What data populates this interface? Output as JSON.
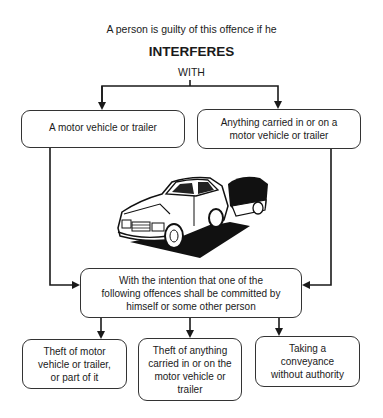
{
  "diagram": {
    "intro": "A person is guilty of this offence if he",
    "title": "INTERFERES",
    "connector": "WITH",
    "targets": [
      {
        "lines": [
          "A motor vehicle or trailer"
        ]
      },
      {
        "lines": [
          "Anything carried in or on a",
          "motor vehicle or trailer"
        ]
      }
    ],
    "image": {
      "icon": "car-with-trailer-illustration"
    },
    "intention": {
      "lines": [
        "With the intention that one of the",
        "following offences shall be committed by",
        "himself or some other person"
      ]
    },
    "offences": [
      {
        "lines": [
          "Theft of motor",
          "vehicle or trailer,",
          "or part of it"
        ]
      },
      {
        "lines": [
          "Theft of anything",
          "carried in or on the",
          "motor vehicle or",
          "trailer"
        ]
      },
      {
        "lines": [
          "Taking a",
          "conveyance",
          "without authority"
        ]
      }
    ],
    "colors": {
      "line": "#1a1a1a",
      "background": "#ffffff"
    }
  }
}
